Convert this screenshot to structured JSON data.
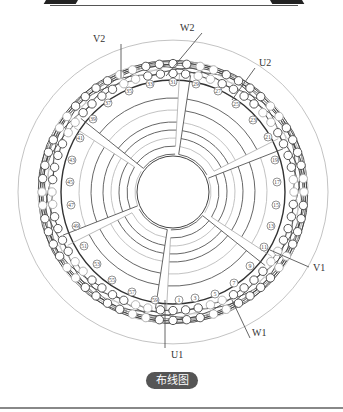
{
  "figure": {
    "caption": "布线图",
    "terminals": [
      {
        "label": "V2",
        "x": 93,
        "y": 42
      },
      {
        "label": "W2",
        "x": 180,
        "y": 31
      },
      {
        "label": "U2",
        "x": 259,
        "y": 66
      },
      {
        "label": "V1",
        "x": 313,
        "y": 271
      },
      {
        "label": "W1",
        "x": 252,
        "y": 336
      },
      {
        "label": "U1",
        "x": 171,
        "y": 358
      }
    ],
    "slot_numbers": [
      {
        "n": "1",
        "x": 179,
        "y": 300
      },
      {
        "n": "3",
        "x": 195,
        "y": 298
      },
      {
        "n": "5",
        "x": 215,
        "y": 294
      },
      {
        "n": "7",
        "x": 234,
        "y": 283
      },
      {
        "n": "9",
        "x": 250,
        "y": 266
      },
      {
        "n": "11",
        "x": 264,
        "y": 247
      },
      {
        "n": "13",
        "x": 271,
        "y": 226
      },
      {
        "n": "15",
        "x": 276,
        "y": 205
      },
      {
        "n": "17",
        "x": 277,
        "y": 182
      },
      {
        "n": "19",
        "x": 275,
        "y": 160
      },
      {
        "n": "21",
        "x": 268,
        "y": 137
      },
      {
        "n": "23",
        "x": 253,
        "y": 120
      },
      {
        "n": "25",
        "x": 236,
        "y": 104
      },
      {
        "n": "27",
        "x": 218,
        "y": 91
      },
      {
        "n": "29",
        "x": 196,
        "y": 84
      },
      {
        "n": "31",
        "x": 173,
        "y": 82
      },
      {
        "n": "33",
        "x": 150,
        "y": 84
      },
      {
        "n": "35",
        "x": 129,
        "y": 91
      },
      {
        "n": "37",
        "x": 108,
        "y": 103
      },
      {
        "n": "39",
        "x": 93,
        "y": 119
      },
      {
        "n": "41",
        "x": 80,
        "y": 138
      },
      {
        "n": "43",
        "x": 72,
        "y": 160
      },
      {
        "n": "45",
        "x": 70,
        "y": 182
      },
      {
        "n": "47",
        "x": 71,
        "y": 205
      },
      {
        "n": "49",
        "x": 76,
        "y": 226
      },
      {
        "n": "51",
        "x": 84,
        "y": 246
      },
      {
        "n": "53",
        "x": 97,
        "y": 264
      },
      {
        "n": "55",
        "x": 112,
        "y": 280
      },
      {
        "n": "57",
        "x": 132,
        "y": 292
      },
      {
        "n": "59",
        "x": 155,
        "y": 300
      }
    ]
  }
}
